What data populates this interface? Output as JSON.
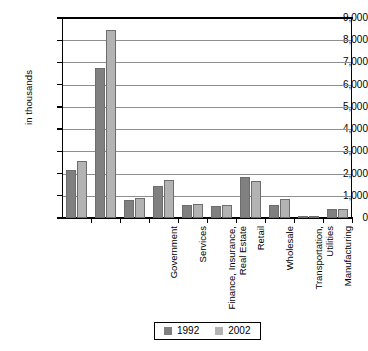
{
  "chart_data": {
    "type": "bar",
    "title": "",
    "xlabel": "",
    "ylabel": "in thousands",
    "ylim": [
      0,
      9000
    ],
    "ytick_labels": [
      "9,000",
      "8,000",
      "7,000",
      "6,000",
      "5,000",
      "4,000",
      "3,000",
      "2,000",
      "1,000",
      "0"
    ],
    "ytick_values": [
      9000,
      8000,
      7000,
      6000,
      5000,
      4000,
      3000,
      2000,
      1000,
      0
    ],
    "grid": true,
    "legend_position": "bottom",
    "categories": [
      "Government",
      "Services",
      "Finance, Insurance,\nReal Estate",
      "Retail",
      "Wholesale",
      "Transportation,\nUtilities",
      "Manufacturing",
      "Construction",
      "Mining",
      "Agriculture"
    ],
    "series": [
      {
        "name": "1992",
        "color": "#808080",
        "values": [
          2150,
          6750,
          800,
          1450,
          600,
          550,
          1850,
          600,
          60,
          400
        ]
      },
      {
        "name": "2002",
        "color": "#b3b3b3",
        "values": [
          2550,
          8450,
          900,
          1700,
          650,
          600,
          1650,
          850,
          45,
          400
        ]
      }
    ]
  },
  "legend": {
    "items": [
      {
        "label": "1992",
        "color": "#808080"
      },
      {
        "label": "2002",
        "color": "#b3b3b3"
      }
    ]
  }
}
